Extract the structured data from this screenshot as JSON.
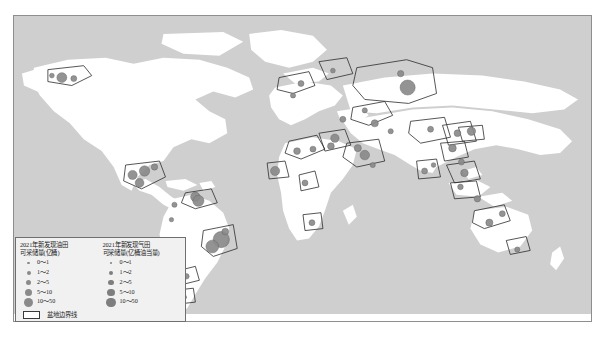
{
  "map": {
    "ocean_color": "#cfcfcf",
    "land_color": "#ffffff",
    "basin_outline_color": "#2b2b2b",
    "dot_color": "#8a8a8a",
    "frame_color": "#8e8e8e"
  },
  "legend": {
    "oil": {
      "title_line1": "2021年新发现油田",
      "title_line2": "可采储量(亿桶)",
      "classes": [
        {
          "label": "0～1",
          "size": "s1"
        },
        {
          "label": "1～2",
          "size": "s2"
        },
        {
          "label": "2～5",
          "size": "s3"
        },
        {
          "label": "5～10",
          "size": "s4"
        },
        {
          "label": "10～50",
          "size": "s5"
        }
      ]
    },
    "gas": {
      "title_line1": "2021年新发现气田",
      "title_line2": "可采储量(亿桶油当量)",
      "classes": [
        {
          "label": "0～1",
          "size": "s1"
        },
        {
          "label": "1～2",
          "size": "s2"
        },
        {
          "label": "2～5",
          "size": "s3"
        },
        {
          "label": "5～10",
          "size": "s4"
        },
        {
          "label": "10～50",
          "size": "s5"
        }
      ]
    },
    "basin_boundary_label": "盆地边界线"
  },
  "chart_data": {
    "type": "map",
    "projection": "world-equirectangular",
    "value_classes_oil": [
      "0～1",
      "1～2",
      "2～5",
      "5～10",
      "10～50"
    ],
    "value_classes_gas": [
      "0～1",
      "1～2",
      "2～5",
      "5～10",
      "10～50"
    ],
    "unit_oil": "亿桶",
    "unit_gas": "亿桶油当量",
    "discoveries": [
      {
        "region": "Alaska North Slope",
        "x": 48,
        "y": 62,
        "r": 5.0,
        "kind": "oil"
      },
      {
        "region": "Alaska North Slope 2",
        "x": 60,
        "y": 63,
        "r": 3.0,
        "kind": "oil"
      },
      {
        "region": "Alaska Beaufort",
        "x": 38,
        "y": 60,
        "r": 2.4,
        "kind": "gas"
      },
      {
        "region": "Gulf of Mexico W",
        "x": 119,
        "y": 160,
        "r": 4.6,
        "kind": "oil"
      },
      {
        "region": "Gulf of Mexico C",
        "x": 131,
        "y": 156,
        "r": 5.2,
        "kind": "oil"
      },
      {
        "region": "Gulf of Mexico E",
        "x": 141,
        "y": 152,
        "r": 3.2,
        "kind": "gas"
      },
      {
        "region": "Mexico Tabasco",
        "x": 126,
        "y": 168,
        "r": 4.4,
        "kind": "oil"
      },
      {
        "region": "Caribbean Trinidad",
        "x": 182,
        "y": 182,
        "r": 4.8,
        "kind": "gas"
      },
      {
        "region": "Guyana Stabroek",
        "x": 185,
        "y": 186,
        "r": 5.6,
        "kind": "oil"
      },
      {
        "region": "Colombia",
        "x": 161,
        "y": 190,
        "r": 2.6,
        "kind": "gas"
      },
      {
        "region": "Peru",
        "x": 158,
        "y": 205,
        "r": 2.2,
        "kind": "oil"
      },
      {
        "region": "Brazil Santos",
        "x": 208,
        "y": 225,
        "r": 8.2,
        "kind": "oil"
      },
      {
        "region": "Brazil Campos",
        "x": 199,
        "y": 232,
        "r": 6.4,
        "kind": "oil"
      },
      {
        "region": "Brazil Sergipe",
        "x": 212,
        "y": 217,
        "r": 3.4,
        "kind": "gas"
      },
      {
        "region": "Argentina Neuquen",
        "x": 173,
        "y": 262,
        "r": 2.8,
        "kind": "oil"
      },
      {
        "region": "Argentina Austral",
        "x": 171,
        "y": 283,
        "r": 2.2,
        "kind": "gas"
      },
      {
        "region": "North Sea",
        "x": 280,
        "y": 80,
        "r": 2.6,
        "kind": "oil"
      },
      {
        "region": "Norwegian Sea",
        "x": 288,
        "y": 68,
        "r": 3.0,
        "kind": "gas"
      },
      {
        "region": "Barents Sea",
        "x": 320,
        "y": 55,
        "r": 2.4,
        "kind": "gas"
      },
      {
        "region": "West Siberia",
        "x": 395,
        "y": 72,
        "r": 7.6,
        "kind": "gas"
      },
      {
        "region": "Kara Sea",
        "x": 388,
        "y": 58,
        "r": 3.2,
        "kind": "gas"
      },
      {
        "region": "Volga Ural",
        "x": 352,
        "y": 95,
        "r": 2.6,
        "kind": "oil"
      },
      {
        "region": "Caspian",
        "x": 362,
        "y": 108,
        "r": 3.6,
        "kind": "oil"
      },
      {
        "region": "Turkmenistan",
        "x": 378,
        "y": 116,
        "r": 2.6,
        "kind": "gas"
      },
      {
        "region": "Black Sea",
        "x": 330,
        "y": 104,
        "r": 3.0,
        "kind": "gas"
      },
      {
        "region": "East Mediterranean",
        "x": 322,
        "y": 123,
        "r": 4.2,
        "kind": "gas"
      },
      {
        "region": "Egypt Nile Delta",
        "x": 318,
        "y": 131,
        "r": 3.4,
        "kind": "gas"
      },
      {
        "region": "Libya Sirte",
        "x": 300,
        "y": 134,
        "r": 3.0,
        "kind": "oil"
      },
      {
        "region": "Algeria",
        "x": 284,
        "y": 136,
        "r": 3.4,
        "kind": "gas"
      },
      {
        "region": "Persian Gulf",
        "x": 352,
        "y": 140,
        "r": 4.8,
        "kind": "gas"
      },
      {
        "region": "Iran Zagros",
        "x": 345,
        "y": 133,
        "r": 3.6,
        "kind": "oil"
      },
      {
        "region": "Oman",
        "x": 360,
        "y": 150,
        "r": 2.6,
        "kind": "oil"
      },
      {
        "region": "Nigeria Niger Delta",
        "x": 292,
        "y": 168,
        "r": 3.0,
        "kind": "oil"
      },
      {
        "region": "West Africa Mauritania",
        "x": 262,
        "y": 156,
        "r": 4.6,
        "kind": "gas"
      },
      {
        "region": "Namibia Orange",
        "x": 299,
        "y": 208,
        "r": 3.0,
        "kind": "oil"
      },
      {
        "region": "India Krishna Godavari",
        "x": 412,
        "y": 156,
        "r": 3.0,
        "kind": "gas"
      },
      {
        "region": "Bengal Basin",
        "x": 421,
        "y": 150,
        "r": 2.4,
        "kind": "gas"
      },
      {
        "region": "Tarim",
        "x": 418,
        "y": 114,
        "r": 3.0,
        "kind": "oil"
      },
      {
        "region": "Ordos",
        "x": 445,
        "y": 118,
        "r": 3.4,
        "kind": "gas"
      },
      {
        "region": "Sichuan",
        "x": 440,
        "y": 133,
        "r": 3.8,
        "kind": "gas"
      },
      {
        "region": "Bohai Bay",
        "x": 459,
        "y": 116,
        "r": 4.2,
        "kind": "oil"
      },
      {
        "region": "South China Sea",
        "x": 452,
        "y": 158,
        "r": 3.8,
        "kind": "gas"
      },
      {
        "region": "Pearl River Mouth",
        "x": 449,
        "y": 147,
        "r": 3.0,
        "kind": "oil"
      },
      {
        "region": "Malay Basin",
        "x": 448,
        "y": 172,
        "r": 2.8,
        "kind": "gas"
      },
      {
        "region": "Indonesia Kutei",
        "x": 465,
        "y": 184,
        "r": 3.2,
        "kind": "gas"
      },
      {
        "region": "Australia NW Shelf",
        "x": 477,
        "y": 208,
        "r": 3.6,
        "kind": "gas"
      },
      {
        "region": "Australia Browse",
        "x": 490,
        "y": 199,
        "r": 3.0,
        "kind": "gas"
      },
      {
        "region": "Australia Gippsland",
        "x": 505,
        "y": 235,
        "r": 2.6,
        "kind": "gas"
      }
    ]
  }
}
